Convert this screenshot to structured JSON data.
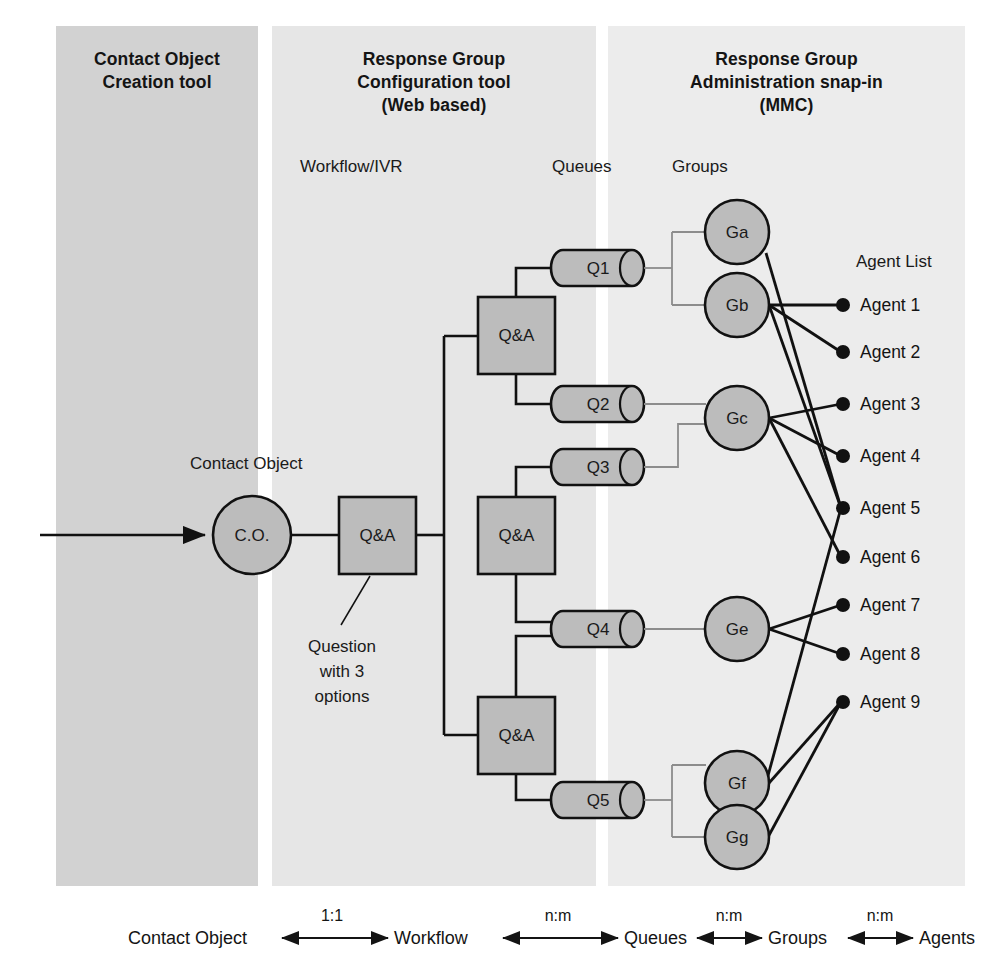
{
  "panels": [
    {
      "id": "co",
      "title": "Contact Object\nCreation tool"
    },
    {
      "id": "config",
      "title": "Response Group\nConfiguration tool\n(Web based)"
    },
    {
      "id": "admin",
      "title": "Response Group\nAdministration snap-in\n(MMC)"
    }
  ],
  "column_labels": {
    "workflow": "Workflow/IVR",
    "queues": "Queues",
    "groups": "Groups",
    "agent_list": "Agent List",
    "contact_object": "Contact Object"
  },
  "nodes": {
    "contact_object": "C.O.",
    "workflow_root": "Q&A",
    "workflow_branches": [
      "Q&A",
      "Q&A",
      "Q&A"
    ],
    "queues": [
      "Q1",
      "Q2",
      "Q3",
      "Q4",
      "Q5"
    ],
    "groups": [
      "Ga",
      "Gb",
      "Gc",
      "Ge",
      "Gf",
      "Gg"
    ],
    "agents": [
      "Agent 1",
      "Agent 2",
      "Agent 3",
      "Agent 4",
      "Agent 5",
      "Agent 6",
      "Agent 7",
      "Agent 8",
      "Agent 9"
    ]
  },
  "callout": {
    "note": "Question\nwith 3\noptions"
  },
  "relationships": {
    "entities": [
      "Contact Object",
      "Workflow",
      "Queues",
      "Groups",
      "Agents"
    ],
    "cardinalities": [
      "1:1",
      "n:m",
      "n:m",
      "n:m"
    ]
  },
  "colors": {
    "panel_co": "#d2d2d2",
    "panel_config": "#e6e6e6",
    "panel_admin": "#ececec",
    "node_fill": "#bcbcbc",
    "stroke": "#111111",
    "thin_stroke": "#8c8c8c",
    "text": "#141414"
  }
}
